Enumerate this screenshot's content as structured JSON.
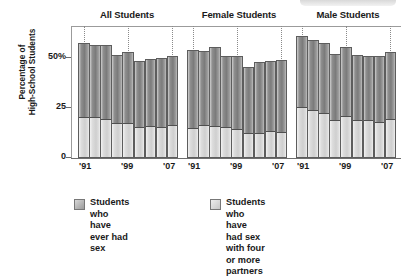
{
  "chart_data": {
    "type": "bar",
    "subtype": "grouped-stacked-column",
    "title": "",
    "ylabel": "Percentage of\nHigh-School Students",
    "xlabel": "",
    "ylim": [
      0,
      62
    ],
    "yticks": [
      0,
      25,
      50
    ],
    "ytick_labels": [
      "0",
      "25",
      "50%"
    ],
    "grid": false,
    "legend_position": "bottom",
    "x": [
      "1991",
      "1993",
      "1995",
      "1997",
      "1999",
      "2001",
      "2003",
      "2005",
      "2007"
    ],
    "xtick_labels": [
      "'91",
      "'99",
      "'07"
    ],
    "xtick_at": [
      "1991",
      "1999",
      "2007"
    ],
    "groups": [
      {
        "name": "All Students",
        "series": [
          {
            "name": "Students who have ever had sex",
            "values": [
              54.1,
              53.0,
              53.1,
              48.4,
              49.9,
              45.6,
              46.7,
              46.8,
              47.8
            ]
          },
          {
            "name": "Students who have had sex with four or more partners",
            "values": [
              18.7,
              18.7,
              17.8,
              16.0,
              16.2,
              14.2,
              14.4,
              14.3,
              14.9
            ]
          }
        ]
      },
      {
        "name": "Female Students",
        "series": [
          {
            "name": "Students who have ever had sex",
            "values": [
              50.8,
              50.2,
              52.1,
              47.7,
              47.7,
              42.9,
              45.3,
              45.7,
              45.9
            ]
          },
          {
            "name": "Students who have had sex with four or more partners",
            "values": [
              13.8,
              15.0,
              14.4,
              14.1,
              13.1,
              11.4,
              11.2,
              12.0,
              11.8
            ]
          }
        ]
      },
      {
        "name": "Male Students",
        "series": [
          {
            "name": "Students who have ever had sex",
            "values": [
              57.4,
              55.6,
              54.0,
              48.9,
              52.2,
              48.5,
              48.0,
              47.9,
              49.8
            ]
          },
          {
            "name": "Students who have had sex with four or more partners",
            "values": [
              23.4,
              22.3,
              20.9,
              17.6,
              19.3,
              17.2,
              17.5,
              16.5,
              17.9
            ]
          }
        ]
      }
    ],
    "legend": [
      {
        "key": "ever-had-sex",
        "label": "Students who have\never had sex",
        "color": "#8f8f8f"
      },
      {
        "key": "four-or-more-partners",
        "label": "Students who have\nhad sex with four\nor more partners",
        "color": "#d6d6d6"
      }
    ]
  },
  "axis": {
    "y_title": "Percentage of\nHigh-School Students",
    "tick_50": "50%",
    "tick_25": "25",
    "tick_0": "0"
  },
  "group_titles": {
    "all": "All Students",
    "female": "Female Students",
    "male": "Male Students"
  },
  "xlabels": {
    "a91": "'91",
    "a99": "'99",
    "a07": "'07",
    "f91": "'91",
    "f99": "'99",
    "f07": "'07",
    "m91": "'91",
    "m99": "'99",
    "m07": "'07"
  },
  "legend": {
    "item1": "Students who have\never had sex",
    "item2": "Students who have\nhad sex with four\nor more partners"
  }
}
